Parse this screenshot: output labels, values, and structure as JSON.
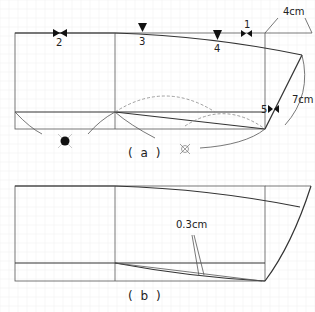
{
  "figure_a": {
    "caption": "( a )",
    "labels": {
      "marker_1": "1",
      "marker_2": "2",
      "marker_3": "3",
      "marker_4": "4",
      "marker_5": "5",
      "dim_top": "4cm",
      "dim_side": "7cm"
    },
    "symbols": [
      "filled-circle-cross-symbol",
      "crossed-box-symbol"
    ]
  },
  "figure_b": {
    "caption": "( b )",
    "labels": {
      "dim_gap": "0.3cm"
    }
  },
  "colors": {
    "line": "#333333",
    "grid": "#ececec",
    "dashed": "#888888"
  }
}
